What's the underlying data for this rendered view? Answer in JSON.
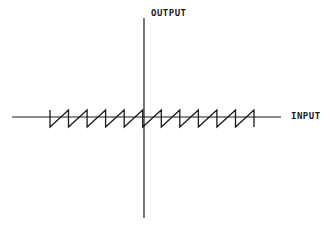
{
  "diagram": {
    "labels": {
      "y_axis": "OUTPUT",
      "x_axis": "INPUT"
    },
    "waveform": {
      "type": "sawtooth",
      "teeth": 11,
      "start_x": 50,
      "end_x": 254,
      "top_y": 110,
      "bottom_y": 127
    },
    "colors": {
      "stroke": "#1a1a1a",
      "background": "#ffffff"
    }
  }
}
